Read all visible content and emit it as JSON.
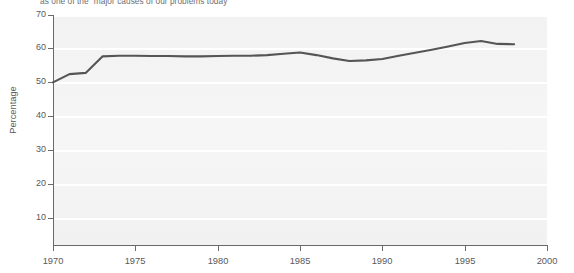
{
  "caption": {
    "fragment": "as one of the “major causes of our problems today”"
  },
  "colors": {
    "line": "#555555",
    "panel": "#f3f3f3",
    "gridline": "#ffffff",
    "axis": "#6a6a6a",
    "text": "#58595b"
  },
  "chart_data": {
    "type": "line",
    "title": "",
    "subtitle": "as one of the “major causes of our problems today”",
    "xlabel": "",
    "ylabel": "Percentage",
    "xlim": [
      1970,
      2000
    ],
    "ylim": [
      0,
      70
    ],
    "xticks": [
      1970,
      1975,
      1980,
      1985,
      1990,
      1995,
      2000
    ],
    "xticklabels": [
      "1970",
      "1975",
      "1980",
      "1985",
      "1990",
      "1995",
      "2000"
    ],
    "yticks": [
      10,
      20,
      30,
      40,
      50,
      60,
      70
    ],
    "yticklabels": [
      "10",
      "20",
      "30",
      "40",
      "50",
      "60",
      "70"
    ],
    "grid": "horizontal-white-gridlines",
    "legend": "none",
    "series": [
      {
        "name": "Percentage naming it a major cause of our problems today",
        "color": "#555555",
        "x": [
          1970,
          1971,
          1972,
          1973,
          1974,
          1975,
          1976,
          1977,
          1978,
          1979,
          1980,
          1981,
          1982,
          1983,
          1984,
          1985,
          1986,
          1987,
          1988,
          1989,
          1990,
          1991,
          1992,
          1993,
          1994,
          1995,
          1996,
          1997,
          1998
        ],
        "values": [
          49.5,
          52.0,
          52.4,
          57.4,
          57.6,
          57.6,
          57.5,
          57.5,
          57.4,
          57.4,
          57.5,
          57.6,
          57.6,
          57.8,
          58.2,
          58.6,
          57.8,
          56.8,
          56.0,
          56.2,
          56.6,
          57.6,
          58.5,
          59.4,
          60.4,
          61.5,
          62.1,
          61.2,
          61.1
        ]
      }
    ]
  }
}
